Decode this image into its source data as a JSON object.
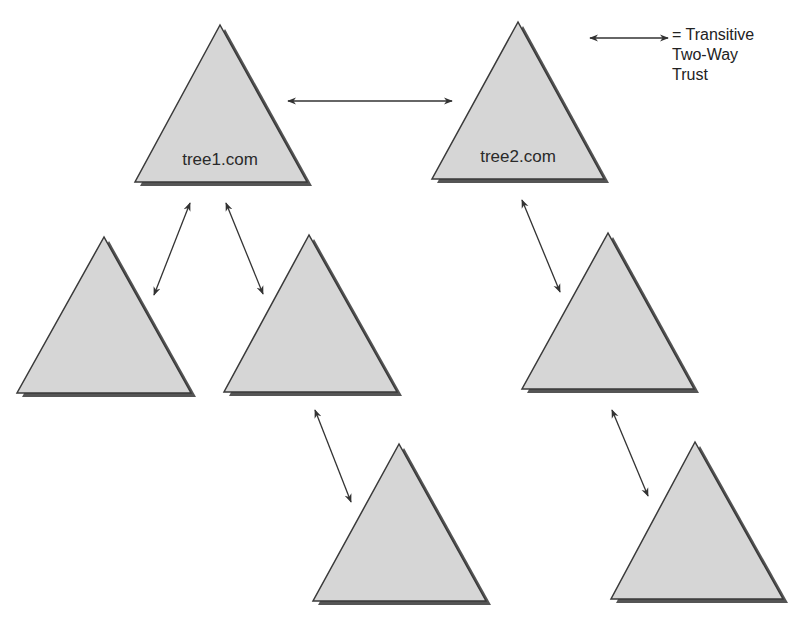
{
  "legend": {
    "symbol": "double-headed-arrow",
    "lines": [
      "= Transitive",
      "Two-Way",
      "Trust"
    ]
  },
  "colors": {
    "fill": "#d6d6d6",
    "outline": "#3a3a3a",
    "shadow": "#555555",
    "arrow": "#333333",
    "text": "#2a2a2a"
  },
  "trees": [
    {
      "id": "t1",
      "label": "tree1.com",
      "apex": [
        220,
        25
      ],
      "left": [
        135,
        182
      ],
      "right": [
        307,
        182
      ]
    },
    {
      "id": "t2",
      "label": "tree2.com",
      "apex": [
        518,
        22
      ],
      "left": [
        432,
        179
      ],
      "right": [
        604,
        179
      ]
    },
    {
      "id": "t3",
      "label": "",
      "apex": [
        104,
        237
      ],
      "left": [
        17,
        393
      ],
      "right": [
        191,
        393
      ]
    },
    {
      "id": "t4",
      "label": "",
      "apex": [
        309,
        235
      ],
      "left": [
        224,
        392
      ],
      "right": [
        397,
        392
      ]
    },
    {
      "id": "t5",
      "label": "",
      "apex": [
        608,
        233
      ],
      "left": [
        522,
        389
      ],
      "right": [
        694,
        389
      ]
    },
    {
      "id": "t6",
      "label": "",
      "apex": [
        399,
        444
      ],
      "left": [
        313,
        601
      ],
      "right": [
        486,
        601
      ]
    },
    {
      "id": "t7",
      "label": "",
      "apex": [
        695,
        442
      ],
      "left": [
        611,
        599
      ],
      "right": [
        783,
        599
      ]
    }
  ],
  "trusts": [
    {
      "from": "tree1.com",
      "to": "tree2.com",
      "x1": 288,
      "y1": 101,
      "x2": 452,
      "y2": 101
    },
    {
      "from": "tree1.com",
      "to": "t3",
      "x1": 190,
      "y1": 203,
      "x2": 154,
      "y2": 295
    },
    {
      "from": "tree1.com",
      "to": "t4",
      "x1": 226,
      "y1": 203,
      "x2": 263,
      "y2": 294
    },
    {
      "from": "tree2.com",
      "to": "t5",
      "x1": 522,
      "y1": 200,
      "x2": 560,
      "y2": 292
    },
    {
      "from": "t4",
      "to": "t6",
      "x1": 315,
      "y1": 410,
      "x2": 351,
      "y2": 502
    },
    {
      "from": "t5",
      "to": "t7",
      "x1": 612,
      "y1": 410,
      "x2": 648,
      "y2": 496
    }
  ],
  "legend_arrow": {
    "x1": 590,
    "y1": 38,
    "x2": 668,
    "y2": 38
  }
}
